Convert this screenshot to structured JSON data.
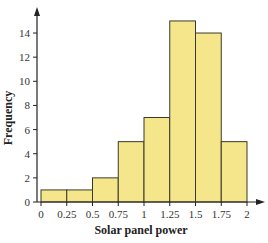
{
  "chart_data": {
    "type": "bar",
    "subtype": "histogram",
    "title": "",
    "xlabel": "Solar panel power",
    "ylabel": "Frequency",
    "bin_edges": [
      0,
      0.25,
      0.5,
      0.75,
      1,
      1.25,
      1.5,
      1.75,
      2
    ],
    "categories": [
      "0-0.25",
      "0.25-0.5",
      "0.5-0.75",
      "0.75-1",
      "1-1.25",
      "1.25-1.5",
      "1.5-1.75",
      "1.75-2"
    ],
    "values": [
      1,
      1,
      2,
      5,
      7,
      15,
      14,
      5
    ],
    "x_tick_labels": [
      "0",
      "0.25",
      "0.5",
      "0.75",
      "1",
      "1.25",
      "1.5",
      "1.75",
      "2"
    ],
    "y_tick_labels": [
      "0",
      "2",
      "4",
      "6",
      "8",
      "10",
      "12",
      "14"
    ],
    "y_ticks": [
      0,
      2,
      4,
      6,
      8,
      10,
      12,
      14
    ],
    "xlim": [
      0,
      2
    ],
    "ylim": [
      0,
      16
    ],
    "grid": false,
    "legend": null,
    "colors": {
      "bar_fill": "#f5e68c",
      "bar_stroke": "#3a3a2a",
      "axis": "#222222"
    }
  }
}
